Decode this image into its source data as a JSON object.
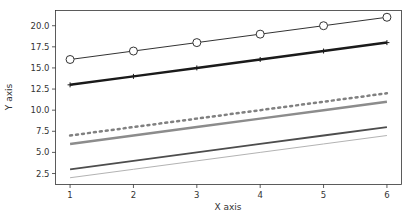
{
  "chart_data": {
    "type": "line",
    "title": "",
    "xlabel": "X axis",
    "ylabel": "Y axis",
    "x": [
      1,
      2,
      3,
      4,
      5,
      6
    ],
    "xlim": [
      0.77,
      6.23
    ],
    "ylim": [
      1.2,
      21.8
    ],
    "xticks": [
      1,
      2,
      3,
      4,
      5,
      6
    ],
    "xtick_labels": [
      "1",
      "2",
      "3",
      "4",
      "5",
      "6"
    ],
    "yticks": [
      2.5,
      5.0,
      7.5,
      10.0,
      12.5,
      15.0,
      17.5,
      20.0
    ],
    "ytick_labels": [
      "2.5",
      "5.0",
      "7.5",
      "10.0",
      "12.5",
      "15.0",
      "17.5",
      "20.0"
    ],
    "grid": false,
    "legend": null,
    "series": [
      {
        "name": "line-circles",
        "values": [
          16,
          17,
          18,
          19,
          20,
          21
        ],
        "color": "#333333",
        "width": 1,
        "dash": "",
        "marker": "circle"
      },
      {
        "name": "line-thick-black",
        "values": [
          13,
          14,
          15,
          16,
          17,
          18
        ],
        "color": "#1a1a1a",
        "width": 2.5,
        "dash": "",
        "marker": "plus"
      },
      {
        "name": "line-dotted",
        "values": [
          7,
          8,
          9,
          10,
          11,
          12
        ],
        "color": "#808080",
        "width": 2.5,
        "dash": "2,4",
        "marker": "none"
      },
      {
        "name": "line-thick-grey",
        "values": [
          6,
          7,
          8,
          9,
          10,
          11
        ],
        "color": "#8c8c8c",
        "width": 2.5,
        "dash": "",
        "marker": "none"
      },
      {
        "name": "line-dark-grey",
        "values": [
          3,
          4,
          5,
          6,
          7,
          8
        ],
        "color": "#4d4d4d",
        "width": 1.8,
        "dash": "",
        "marker": "none"
      },
      {
        "name": "line-light-grey",
        "values": [
          2,
          3,
          4,
          5,
          6,
          7
        ],
        "color": "#b3b3b3",
        "width": 1,
        "dash": "",
        "marker": "none"
      }
    ]
  }
}
